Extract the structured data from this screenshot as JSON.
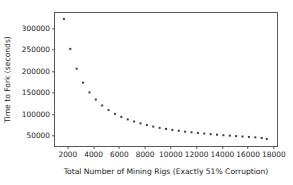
{
  "chart_data": {
    "type": "scatter",
    "title": "",
    "xlabel": "Total Number of Mining Rigs (Exactly 51% Corruption)",
    "ylabel": "Time to Fork (seconds)",
    "xlim": [
      1000,
      18400
    ],
    "ylim": [
      22000,
      337000
    ],
    "grid": false,
    "legend": null,
    "marker": "square",
    "marker_color": "#3a3a3a",
    "marker_size_px": 2.0,
    "xticks": [
      2000,
      4000,
      6000,
      8000,
      10000,
      12000,
      14000,
      16000,
      18000
    ],
    "xtick_labels": [
      "2000",
      "4000",
      "6000",
      "8000",
      "10000",
      "12000",
      "14000",
      "16000",
      "18000"
    ],
    "yticks": [
      50000,
      100000,
      150000,
      200000,
      250000,
      300000
    ],
    "ytick_labels": [
      "50000",
      "100000",
      "150000",
      "200000",
      "250000",
      "300000"
    ],
    "series": [
      {
        "name": "Time to Fork",
        "x": [
          1700,
          2200,
          2700,
          3200,
          3700,
          4200,
          4700,
          5200,
          5700,
          6200,
          6700,
          7200,
          7700,
          8200,
          8700,
          9200,
          9700,
          10200,
          10700,
          11200,
          11700,
          12200,
          12700,
          13200,
          13700,
          14200,
          14700,
          15200,
          15700,
          16200,
          16700,
          17200,
          17600
        ],
        "y": [
          323000,
          252000,
          205000,
          172000,
          149000,
          132000,
          118000,
          107000,
          98000,
          91000,
          85000,
          80000,
          75500,
          71500,
          68000,
          65000,
          62500,
          60000,
          58000,
          56000,
          54500,
          53000,
          51500,
          50000,
          48800,
          47500,
          46500,
          45500,
          44500,
          43500,
          42500,
          41000,
          38500
        ]
      }
    ]
  }
}
